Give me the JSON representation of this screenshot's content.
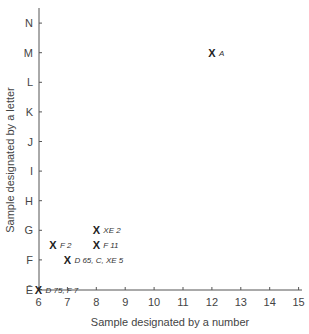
{
  "chart_data": {
    "type": "scatter",
    "title": "",
    "xlabel": "Sample designated by a number",
    "ylabel": "Sample designated by a letter",
    "x_ticks": [
      6,
      7,
      8,
      9,
      10,
      11,
      12,
      13,
      14,
      15
    ],
    "y_ticks": [
      "Ē",
      "F",
      "G",
      "H",
      "I",
      "J",
      "K",
      "L",
      "M",
      "N"
    ],
    "xlim": [
      6,
      15
    ],
    "ylim": [
      "Ē",
      "N"
    ],
    "grid": false,
    "legend": null,
    "marker": "X",
    "points": [
      {
        "label": "A",
        "x": 12,
        "y": "M",
        "y_index": 8
      },
      {
        "label": "XE 2",
        "x": 8,
        "y": "G",
        "y_index": 2
      },
      {
        "label": "F 2",
        "x": 6.5,
        "y": "F–G",
        "y_index": 1.5
      },
      {
        "label": "F 11",
        "x": 8,
        "y": "F–G",
        "y_index": 1.5
      },
      {
        "label": "D 65, C, XE 5",
        "x": 7,
        "y": "F",
        "y_index": 1
      },
      {
        "label": "D 75, F 7",
        "x": 6,
        "y": "Ē",
        "y_index": 0
      }
    ]
  }
}
